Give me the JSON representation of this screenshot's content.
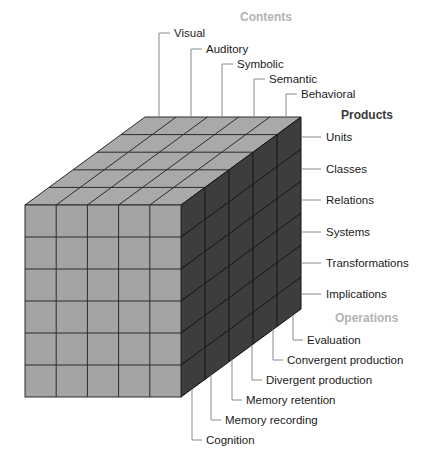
{
  "colors": {
    "front_face": "#a4a4a4",
    "top_face": "#a9a9a9",
    "side_face": "#3d3d3d",
    "grid_light": "#2b2b2b",
    "grid_dark": "#151515",
    "label_text": "#1a1a1a",
    "header_contents": "#b3b3b3",
    "header_products": "#3a3a3a",
    "header_operations": "#b3b3b3",
    "leader": "#8a8a8a"
  },
  "cube": {
    "front": {
      "x": 25,
      "y": 205,
      "width": 156,
      "height": 192,
      "cols": 5,
      "rows": 6
    },
    "depth": {
      "dx": 120,
      "dy": -88,
      "layers": 5
    }
  },
  "dimensions": {
    "contents": {
      "header": "Contents",
      "header_pos": {
        "x": 240,
        "y": 21
      },
      "items": [
        {
          "label": "Visual",
          "leader_x": 159,
          "y": 33
        },
        {
          "label": "Auditory",
          "leader_x": 191,
          "y": 49
        },
        {
          "label": "Symbolic",
          "leader_x": 222,
          "y": 64
        },
        {
          "label": "Semantic",
          "leader_x": 254,
          "y": 79
        },
        {
          "label": "Behavioral",
          "leader_x": 286,
          "y": 94
        }
      ]
    },
    "products": {
      "header": "Products",
      "header_pos": {
        "x": 341,
        "y": 119
      },
      "items": [
        {
          "label": "Units",
          "y": 137
        },
        {
          "label": "Classes",
          "y": 169
        },
        {
          "label": "Relations",
          "y": 200
        },
        {
          "label": "Systems",
          "y": 232
        },
        {
          "label": "Transformations",
          "y": 263
        },
        {
          "label": "Implications",
          "y": 294
        }
      ]
    },
    "operations": {
      "header": "Operations",
      "header_pos": {
        "x": 335,
        "y": 322
      },
      "items": [
        {
          "label": "Evaluation",
          "leader_x": 293,
          "y": 340
        },
        {
          "label": "Convergent production",
          "leader_x": 273,
          "y": 360
        },
        {
          "label": "Divergent production",
          "leader_x": 252,
          "y": 380
        },
        {
          "label": "Memory retention",
          "leader_x": 232,
          "y": 400
        },
        {
          "label": "Memory recording",
          "leader_x": 211,
          "y": 420
        },
        {
          "label": "Cognition",
          "leader_x": 192,
          "y": 440
        }
      ]
    }
  }
}
